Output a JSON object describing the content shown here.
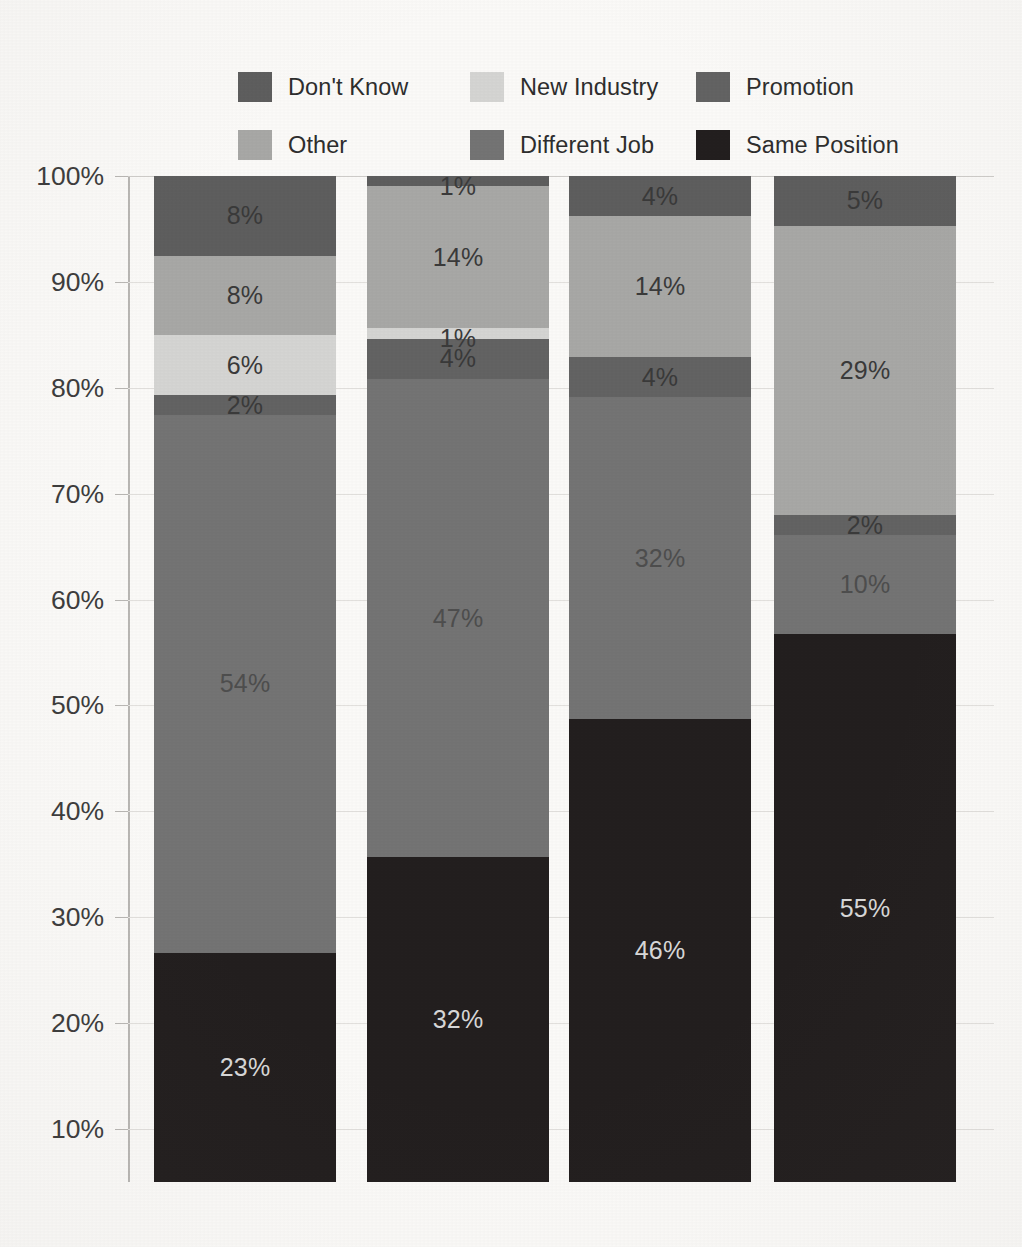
{
  "legend": {
    "items": [
      {
        "label": "Don't Know",
        "color": "#5e5e5e",
        "swatch_name": "legend-swatch-dont-know"
      },
      {
        "label": "New Industry",
        "color": "#d5d5d3",
        "swatch_name": "legend-swatch-new-industry"
      },
      {
        "label": "Promotion",
        "color": "#636363",
        "swatch_name": "legend-swatch-promotion"
      },
      {
        "label": "Other",
        "color": "#a8a8a6",
        "swatch_name": "legend-swatch-other"
      },
      {
        "label": "Different Job",
        "color": "#747474",
        "swatch_name": "legend-swatch-different-job"
      },
      {
        "label": "Same Position",
        "color": "#231f1f",
        "swatch_name": "legend-swatch-same-position"
      }
    ]
  },
  "axis": {
    "ticks": [
      "100%",
      "90%",
      "80%",
      "70%",
      "60%",
      "50%",
      "40%",
      "30%",
      "20%",
      "10%"
    ],
    "tick_values": [
      100,
      90,
      80,
      70,
      60,
      50,
      40,
      30,
      20,
      10
    ]
  },
  "chart_data": {
    "type": "bar",
    "subtype": "100% stacked bar",
    "title": "",
    "xlabel": "",
    "ylabel": "",
    "ylim": [
      5,
      100
    ],
    "grid": true,
    "legend_position": "top",
    "categories": [
      "Bar 1",
      "Bar 2",
      "Bar 3",
      "Bar 4"
    ],
    "series": [
      {
        "name": "Same Position",
        "color": "#231f1f",
        "values": [
          23,
          32,
          46,
          55
        ],
        "labels": [
          "23%",
          "32%",
          "46%",
          "55%"
        ]
      },
      {
        "name": "Different Job",
        "color": "#747474",
        "values": [
          54,
          47,
          32,
          10
        ],
        "labels": [
          "54%",
          "47%",
          "32%",
          "10%"
        ]
      },
      {
        "name": "Promotion",
        "color": "#636363",
        "values": [
          2,
          4,
          4,
          2
        ],
        "labels": [
          "2%",
          "4%",
          "4%",
          "2%"
        ]
      },
      {
        "name": "New Industry",
        "color": "#d5d5d3",
        "values": [
          6,
          1,
          0,
          0
        ],
        "labels": [
          "6%",
          "1%",
          "",
          ""
        ]
      },
      {
        "name": "Other",
        "color": "#a8a8a6",
        "values": [
          8,
          14,
          14,
          29
        ],
        "labels": [
          "8%",
          "14%",
          "14%",
          "29%"
        ]
      },
      {
        "name": "Don't Know",
        "color": "#5e5e5e",
        "values": [
          8,
          1,
          4,
          5
        ],
        "labels": [
          "8%",
          "1%",
          "4%",
          "5%"
        ]
      }
    ]
  },
  "bars": [
    {
      "name": "bar-1",
      "segments": [
        {
          "label": "8%",
          "value": 8,
          "series": "Don't Know",
          "color": "#5e5e5e",
          "text": "dark"
        },
        {
          "label": "8%",
          "value": 8,
          "series": "Other",
          "color": "#a8a8a6",
          "text": "dark"
        },
        {
          "label": "6%",
          "value": 6,
          "series": "New Industry",
          "color": "#d5d5d3",
          "text": "dark"
        },
        {
          "label": "2%",
          "value": 2,
          "series": "Promotion",
          "color": "#636363",
          "text": "dark"
        },
        {
          "label": "54%",
          "value": 54,
          "series": "Different Job",
          "color": "#747474",
          "text": "midlabel"
        },
        {
          "label": "23%",
          "value": 23,
          "series": "Same Position",
          "color": "#231f1f",
          "text": "light"
        }
      ]
    },
    {
      "name": "bar-2",
      "segments": [
        {
          "label": "1%",
          "value": 1,
          "series": "Don't Know",
          "color": "#5e5e5e",
          "text": "dark"
        },
        {
          "label": "14%",
          "value": 14,
          "series": "Other",
          "color": "#a8a8a6",
          "text": "dark"
        },
        {
          "label": "1%",
          "value": 1,
          "series": "New Industry",
          "color": "#d5d5d3",
          "text": "dark"
        },
        {
          "label": "4%",
          "value": 4,
          "series": "Promotion",
          "color": "#636363",
          "text": "dark"
        },
        {
          "label": "47%",
          "value": 47,
          "series": "Different Job",
          "color": "#747474",
          "text": "midlabel"
        },
        {
          "label": "32%",
          "value": 32,
          "series": "Same Position",
          "color": "#231f1f",
          "text": "light"
        }
      ]
    },
    {
      "name": "bar-3",
      "segments": [
        {
          "label": "4%",
          "value": 4,
          "series": "Don't Know",
          "color": "#5e5e5e",
          "text": "dark"
        },
        {
          "label": "14%",
          "value": 14,
          "series": "Other",
          "color": "#a8a8a6",
          "text": "dark"
        },
        {
          "label": "4%",
          "value": 4,
          "series": "Promotion",
          "color": "#636363",
          "text": "dark"
        },
        {
          "label": "32%",
          "value": 32,
          "series": "Different Job",
          "color": "#747474",
          "text": "midlabel"
        },
        {
          "label": "46%",
          "value": 46,
          "series": "Same Position",
          "color": "#231f1f",
          "text": "light"
        }
      ]
    },
    {
      "name": "bar-4",
      "segments": [
        {
          "label": "5%",
          "value": 5,
          "series": "Don't Know",
          "color": "#5e5e5e",
          "text": "dark"
        },
        {
          "label": "29%",
          "value": 29,
          "series": "Other",
          "color": "#a8a8a6",
          "text": "dark"
        },
        {
          "label": "2%",
          "value": 2,
          "series": "Promotion",
          "color": "#636363",
          "text": "dark"
        },
        {
          "label": "10%",
          "value": 10,
          "series": "Different Job",
          "color": "#747474",
          "text": "midlabel"
        },
        {
          "label": "55%",
          "value": 55,
          "series": "Same Position",
          "color": "#231f1f",
          "text": "light"
        }
      ]
    }
  ]
}
